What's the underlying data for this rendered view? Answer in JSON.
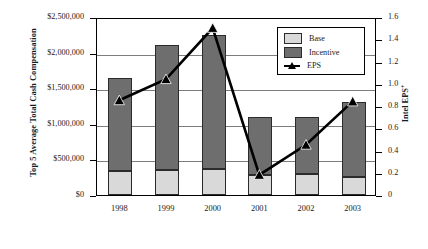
{
  "chart_data": {
    "type": "bar",
    "title": "",
    "subtitle": "",
    "categories": [
      "1998",
      "1999",
      "2000",
      "2001",
      "2002",
      "2003"
    ],
    "xlabel": "",
    "ylabel": "Top 5 Average Total Cash Compensation",
    "ylabel_right": "Intel EPS",
    "ylabel_right_superscript": "+",
    "ylim": [
      0,
      2500000
    ],
    "ylim_right": [
      0,
      1.6
    ],
    "grid": true,
    "legend_position": "top-right",
    "stacked": true,
    "series": [
      {
        "name": "Base",
        "type": "bar",
        "axis": "left",
        "color": "#d9d9d9",
        "values": [
          340000,
          345000,
          365000,
          280000,
          300000,
          250000
        ]
      },
      {
        "name": "Incentive",
        "type": "bar",
        "axis": "left",
        "color": "#6e6e6e",
        "values": [
          1310000,
          1755000,
          1885000,
          820000,
          800000,
          1050000
        ]
      },
      {
        "name": "EPS",
        "type": "line",
        "axis": "right",
        "color": "#000000",
        "marker": "triangle",
        "values": [
          0.86,
          1.05,
          1.51,
          0.19,
          0.46,
          0.85
        ]
      }
    ],
    "totals": [
      1650000,
      2100000,
      2250000,
      1100000,
      1100000,
      1300000
    ],
    "ytick_labels": [
      "$2,500,000",
      "$2,000,000",
      "$1,500,000",
      "$1,000,000",
      "$500,000",
      "$0"
    ],
    "ytick_values": [
      2500000,
      2000000,
      1500000,
      1000000,
      500000,
      0
    ],
    "ytick_labels_right": [
      "1.6",
      "1.4",
      "1.2",
      "1.0",
      "0.8",
      "0.6",
      "0.4",
      "0.2",
      "0"
    ],
    "ytick_values_right": [
      1.6,
      1.4,
      1.2,
      1.0,
      0.8,
      0.6,
      0.4,
      0.2,
      0
    ]
  },
  "legend": {
    "items": [
      {
        "label": "Base",
        "swatch": "base-swatch"
      },
      {
        "label": "Incentive",
        "swatch": "incentive-swatch"
      },
      {
        "label": "EPS",
        "swatch": "eps-line-marker"
      }
    ]
  }
}
